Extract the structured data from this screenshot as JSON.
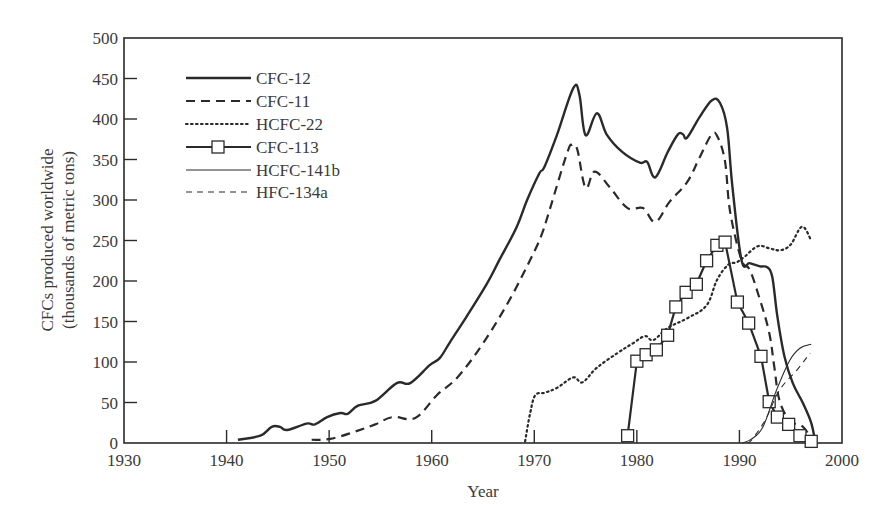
{
  "chart_data": {
    "type": "line",
    "title": "",
    "xlabel": "Year",
    "ylabel": "CFCs produced worldwide\n(thousands of metric tons)",
    "ylabel_lines": [
      "CFCs produced worldwide",
      "(thousands of metric tons)"
    ],
    "xlim": [
      1930,
      2000
    ],
    "ylim": [
      0,
      500
    ],
    "x_ticks": [
      1930,
      1940,
      1950,
      1960,
      1970,
      1980,
      1990,
      2000
    ],
    "y_ticks": [
      0,
      50,
      100,
      150,
      200,
      250,
      300,
      350,
      400,
      450,
      500
    ],
    "grid": false,
    "legend_position": "upper-left",
    "series": [
      {
        "name": "CFC-12",
        "style": "solid-thick",
        "x": [
          1941.1,
          1943.3,
          1944.4,
          1945.2,
          1945.9,
          1947.8,
          1948.6,
          1949.8,
          1951.1,
          1951.8,
          1952.8,
          1954.5,
          1956.6,
          1957.9,
          1959.8,
          1960.8,
          1961.8,
          1963.4,
          1965.4,
          1966.6,
          1968.3,
          1969.3,
          1970.5,
          1971.0,
          1972.2,
          1973.8,
          1974.4,
          1975.0,
          1976.1,
          1977.1,
          1978.6,
          1980.3,
          1981.0,
          1981.8,
          1983.0,
          1984.0,
          1984.5,
          1984.9,
          1986.1,
          1987.3,
          1988.1,
          1988.8,
          1989.3,
          1990.2,
          1991.0,
          1992.0,
          1992.7,
          1993.2,
          1993.7,
          1994.4,
          1995.2,
          1996.2,
          1997.0,
          1997.4
        ],
        "values": [
          4,
          9,
          20,
          20,
          16,
          24,
          23,
          32,
          37,
          36,
          46,
          52,
          74,
          74,
          96,
          105,
          125,
          156,
          197,
          226,
          267,
          300,
          333,
          341,
          380,
          438,
          430,
          380,
          407,
          380,
          359,
          346,
          347,
          328,
          359,
          381,
          381,
          377,
          402,
          423,
          420,
          389,
          319,
          226,
          222,
          218,
          217,
          205,
          156,
          106,
          74,
          49,
          25,
          1
        ]
      },
      {
        "name": "CFC-11",
        "style": "dashed-thick",
        "x": [
          1948.3,
          1950.1,
          1952.5,
          1954.5,
          1956.2,
          1958.4,
          1960.5,
          1962.5,
          1965.0,
          1967.6,
          1969.9,
          1970.8,
          1971.5,
          1973.2,
          1973.7,
          1974.2,
          1975.0,
          1975.9,
          1977.4,
          1979.1,
          1980.6,
          1981.8,
          1983.2,
          1984.9,
          1986.1,
          1987.3,
          1987.9,
          1988.6,
          1989.1,
          1990.2,
          1991.0,
          1992.0,
          1992.9,
          1993.4,
          1993.9,
          1994.9,
          1996.2,
          1996.9
        ],
        "values": [
          4,
          5,
          14,
          23,
          32,
          31,
          59,
          81,
          123,
          177,
          234,
          260,
          288,
          358,
          368,
          362,
          315,
          335,
          315,
          290,
          290,
          273,
          298,
          322,
          352,
          381,
          377,
          347,
          285,
          226,
          214,
          177,
          136,
          94,
          53,
          28,
          20,
          7
        ]
      },
      {
        "name": "HCFC-22",
        "style": "dotted",
        "x": [
          1969.1,
          1969.6,
          1970.1,
          1971.0,
          1972.2,
          1973.8,
          1974.7,
          1976.1,
          1978.1,
          1979.6,
          1980.8,
          1981.6,
          1983.0,
          1984.9,
          1986.8,
          1987.8,
          1988.9,
          1989.7,
          1990.5,
          1991.8,
          1993.0,
          1994.0,
          1995.0,
          1996.1,
          1997.0
        ],
        "values": [
          2,
          37,
          59,
          62,
          68,
          81,
          75,
          93,
          111,
          123,
          132,
          127,
          142,
          154,
          170,
          201,
          220,
          223,
          230,
          243,
          240,
          238,
          245,
          267,
          250
        ]
      },
      {
        "name": "CFC-113",
        "style": "solid-square-markers",
        "x": [
          1979.1,
          1980.0,
          1980.9,
          1981.9,
          1983.0,
          1983.8,
          1984.8,
          1985.8,
          1986.8,
          1987.8,
          1988.6,
          1989.8,
          1990.9,
          1992.1,
          1992.9,
          1993.7,
          1994.8,
          1995.9,
          1997.0
        ],
        "values": [
          9,
          101,
          109,
          115,
          133,
          168,
          186,
          196,
          225,
          244,
          248,
          174,
          148,
          107,
          51,
          32,
          23,
          9,
          2
        ]
      },
      {
        "name": "HCFC-141b",
        "style": "solid-thin",
        "x": [
          1990.3,
          1991.2,
          1992.3,
          1993.6,
          1994.9,
          1995.9,
          1997.0
        ],
        "values": [
          0,
          5,
          20,
          65,
          102,
          117,
          122
        ]
      },
      {
        "name": "HFC-134a",
        "style": "dashed-thin",
        "x": [
          1990.8,
          1991.2,
          1992.5,
          1993.9,
          1995.6,
          1996.9
        ],
        "values": [
          0,
          4,
          28,
          65,
          90,
          111
        ]
      }
    ]
  }
}
